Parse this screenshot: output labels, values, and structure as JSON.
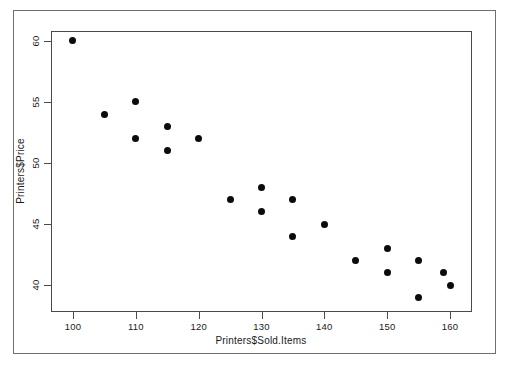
{
  "chart_data": {
    "type": "scatter",
    "title": "",
    "xlabel": "Printers$Sold.Items",
    "ylabel": "Printers$Price",
    "xlim": [
      96.5,
      163.5
    ],
    "ylim": [
      37.8,
      60.8
    ],
    "xticks": [
      100,
      110,
      120,
      130,
      140,
      150,
      160
    ],
    "yticks": [
      40,
      45,
      50,
      55,
      60
    ],
    "grid": false,
    "legend": null,
    "marker": {
      "shape": "filled-circle",
      "color": "#0b0b0b",
      "size_px": 7
    },
    "points": [
      {
        "x": 100,
        "y": 60
      },
      {
        "x": 105,
        "y": 54
      },
      {
        "x": 110,
        "y": 55
      },
      {
        "x": 110,
        "y": 52
      },
      {
        "x": 115,
        "y": 53
      },
      {
        "x": 115,
        "y": 51
      },
      {
        "x": 120,
        "y": 52
      },
      {
        "x": 125,
        "y": 47
      },
      {
        "x": 130,
        "y": 48
      },
      {
        "x": 130,
        "y": 46
      },
      {
        "x": 135,
        "y": 47
      },
      {
        "x": 135,
        "y": 44
      },
      {
        "x": 140,
        "y": 45
      },
      {
        "x": 145,
        "y": 42
      },
      {
        "x": 150,
        "y": 43
      },
      {
        "x": 150,
        "y": 41
      },
      {
        "x": 155,
        "y": 42
      },
      {
        "x": 155,
        "y": 39
      },
      {
        "x": 159,
        "y": 41
      },
      {
        "x": 160,
        "y": 40
      }
    ]
  },
  "figure": {
    "background_color": "#ffffff",
    "frame_color": "#6f6f6f",
    "panel_border_color": "#4a4a4a",
    "axis_text_color": "#1a1a1a"
  }
}
